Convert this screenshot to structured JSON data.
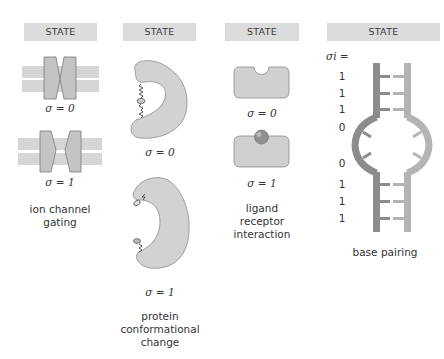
{
  "panels": [
    {
      "header": "STATE",
      "states": [
        {
          "label": "σ = 0"
        },
        {
          "label": "σ = 1"
        }
      ],
      "caption": [
        "ion channel",
        "gating"
      ]
    },
    {
      "header": "STATE",
      "states": [
        {
          "label": "σ = 0"
        },
        {
          "label": "σ = 1"
        }
      ],
      "caption": [
        "protein",
        "conformational",
        "change"
      ]
    },
    {
      "header": "STATE",
      "states": [
        {
          "label": "σ = 0"
        },
        {
          "label": "σ = 1"
        }
      ],
      "caption": [
        "ligand",
        "receptor",
        "interaction"
      ]
    },
    {
      "header": "STATE",
      "sigma_label": "σi =",
      "values": [
        "1",
        "1",
        "1",
        "0",
        "0",
        "1",
        "1",
        "1"
      ],
      "caption": [
        "base pairing"
      ]
    }
  ],
  "colors": {
    "header_bg": "#dcdcdc",
    "membrane": "#d6d6d6",
    "protein": "#c8c8c8",
    "outline": "#7a7a7a",
    "strand_dark": "#8c8c8c",
    "strand_light": "#b4b4b4",
    "ligand": "#8f8f8f"
  }
}
